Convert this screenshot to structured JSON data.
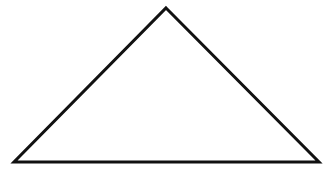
{
  "diagram": {
    "shape": "triangle",
    "background": "#ffffff",
    "stroke_color": "#111111",
    "stroke_width": 3,
    "fill": "none",
    "vertices": {
      "apex": [
        166,
        8
      ],
      "bottom_left": [
        14,
        162
      ],
      "bottom_right": [
        319,
        162
      ]
    }
  }
}
